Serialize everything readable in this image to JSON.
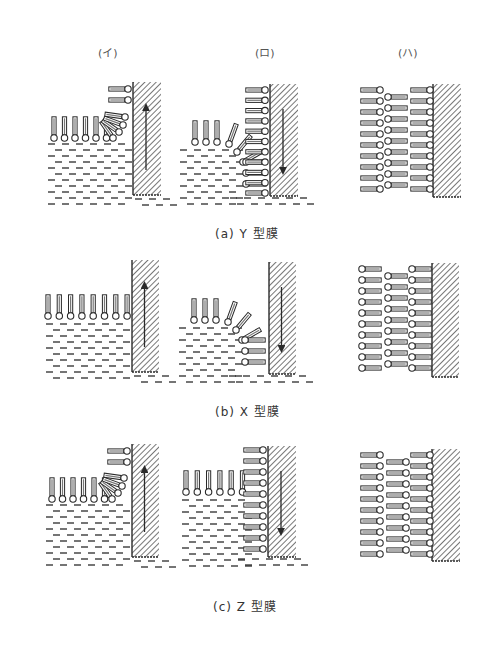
{
  "figure": {
    "column_headers": [
      {
        "label": "(イ)",
        "x": 98,
        "y": 48
      },
      {
        "label": "(ロ)",
        "x": 255,
        "y": 48
      },
      {
        "label": "(ハ)",
        "x": 398,
        "y": 48
      }
    ],
    "rows": [
      {
        "caption": "(a)  Y 型膜",
        "caption_x": 215,
        "caption_y": 224,
        "panels": [
          {
            "type": "upstroke_curl",
            "substrate": {
              "x": 133,
              "y": 82,
              "w": 28,
              "h": 113
            },
            "arrow": "up",
            "surface_y": 138,
            "tail_count": 6,
            "start_x": 54,
            "stacked_on_substrate": 2
          },
          {
            "type": "downstroke_fold",
            "substrate": {
              "x": 270,
              "y": 84,
              "w": 28,
              "h": 112
            },
            "arrow": "down",
            "stacked_count": 11,
            "submerged": 3
          },
          {
            "type": "multilayer",
            "substrate": {
              "x": 433,
              "y": 84,
              "w": 28,
              "h": 113
            },
            "columns": [
              {
                "x": 362,
                "count": 10,
                "head": "right"
              },
              {
                "x": 388,
                "count": 9,
                "head": "left"
              },
              {
                "x": 412,
                "count": 10,
                "head": "right"
              }
            ]
          }
        ]
      },
      {
        "caption": "(b)  X 型膜",
        "caption_x": 215,
        "caption_y": 402,
        "panels": [
          {
            "type": "upstroke_flat",
            "substrate": {
              "x": 132,
              "y": 260,
              "w": 27,
              "h": 112
            },
            "arrow": "up",
            "surface_y": 316,
            "tail_count": 8,
            "start_x": 48
          },
          {
            "type": "downstroke_fold",
            "substrate": {
              "x": 269,
              "y": 262,
              "w": 27,
              "h": 112
            },
            "arrow": "down",
            "stacked_count": 3,
            "submerged": 3
          },
          {
            "type": "multilayer",
            "substrate": {
              "x": 432,
              "y": 263,
              "w": 27,
              "h": 114
            },
            "columns": [
              {
                "x": 362,
                "count": 10,
                "head": "left"
              },
              {
                "x": 388,
                "count": 9,
                "head": "left"
              },
              {
                "x": 412,
                "count": 10,
                "head": "left"
              }
            ]
          }
        ]
      },
      {
        "caption": "(c)  Z 型膜",
        "caption_x": 213,
        "caption_y": 597,
        "panels": [
          {
            "type": "upstroke_curl",
            "substrate": {
              "x": 132,
              "y": 444,
              "w": 27,
              "h": 113
            },
            "arrow": "up",
            "surface_y": 499,
            "tail_count": 6,
            "start_x": 52,
            "stacked_on_substrate": 2
          },
          {
            "type": "downstroke_stack",
            "substrate": {
              "x": 268,
              "y": 446,
              "w": 28,
              "h": 111
            },
            "arrow": "down",
            "stacked_count": 10,
            "tail_count": 6,
            "start_x": 186
          },
          {
            "type": "multilayer",
            "substrate": {
              "x": 432,
              "y": 449,
              "w": 28,
              "h": 112
            },
            "columns": [
              {
                "x": 362,
                "count": 10,
                "head": "right"
              },
              {
                "x": 388,
                "count": 9,
                "head": "right"
              },
              {
                "x": 412,
                "count": 10,
                "head": "right"
              }
            ]
          }
        ]
      }
    ]
  },
  "colors": {
    "ink": "#2a2a2a",
    "tail_fill": "#ffffff",
    "hatch": "#555555"
  }
}
